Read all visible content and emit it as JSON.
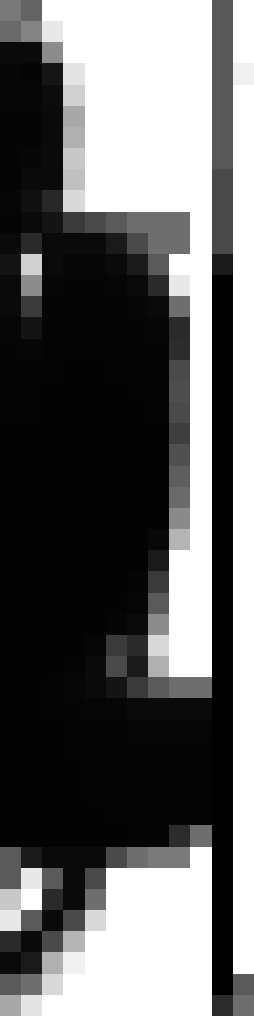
{
  "view": {
    "kind": "magnified-screenshot-crop",
    "description": "Extreme nearest-neighbour magnification of a small screenshot region; anti-aliased dark glyph/UI edges over a white background with a dark vertical bar at the right.",
    "width_px": 254,
    "height_px": 1016,
    "grid_columns": 12,
    "grid_rows": 48,
    "block_width_px": 21.17,
    "block_height_px": 21.17,
    "interpolation": "nearest-neighbor",
    "color_mode": "grayscale"
  },
  "palette": {
    "white": "#ffffff",
    "near_white": "#f4f4f4",
    "light_gray": "#d8d8d8",
    "mid_light_gray": "#b4b4b4",
    "mid_gray": "#8c8c8c",
    "slate_gray": "#6e6e6e",
    "dark_gray": "#4a4a4a",
    "darker_gray": "#2c2c2c",
    "near_black": "#141414",
    "black": "#000000"
  },
  "regions": [
    {
      "name": "top-left-dark-mass",
      "note": "Large black shape occupying the upper-left, bounded by a soft gray anti-alias ramp on its right edge."
    },
    {
      "name": "white-field",
      "note": "Bright white background filling the upper-right and mid-right of the crop."
    },
    {
      "name": "right-vertical-bar",
      "note": "Dark vertical band along column 10, grading from mid gray at the top to solid black below."
    },
    {
      "name": "bottom-white-block",
      "note": "White rounded mass in the lower third with stepped gray anti-alias edges."
    }
  ],
  "pixels": [
    [
      "#787878",
      "#646464",
      "#ffffff",
      "#ffffff",
      "#ffffff",
      "#ffffff",
      "#ffffff",
      "#ffffff",
      "#ffffff",
      "#ffffff",
      "#585858",
      "#ffffff"
    ],
    [
      "#6a6a6a",
      "#848484",
      "#e8e8e8",
      "#ffffff",
      "#ffffff",
      "#ffffff",
      "#ffffff",
      "#ffffff",
      "#ffffff",
      "#ffffff",
      "#585858",
      "#ffffff"
    ],
    [
      "#0a0a0a",
      "#0a0a0a",
      "#8c8c8c",
      "#ffffff",
      "#ffffff",
      "#ffffff",
      "#ffffff",
      "#ffffff",
      "#ffffff",
      "#ffffff",
      "#585858",
      "#ffffff"
    ],
    [
      "#070707",
      "#050505",
      "#151515",
      "#e4e4e4",
      "#ffffff",
      "#ffffff",
      "#ffffff",
      "#ffffff",
      "#ffffff",
      "#ffffff",
      "#585858",
      "#f0f0f0"
    ],
    [
      "#060606",
      "#060606",
      "#0c0c0c",
      "#d0d0d0",
      "#ffffff",
      "#ffffff",
      "#ffffff",
      "#ffffff",
      "#ffffff",
      "#ffffff",
      "#585858",
      "#ffffff"
    ],
    [
      "#050505",
      "#050505",
      "#0a0a0a",
      "#a8a8a8",
      "#ffffff",
      "#ffffff",
      "#ffffff",
      "#ffffff",
      "#ffffff",
      "#ffffff",
      "#585858",
      "#ffffff"
    ],
    [
      "#050505",
      "#050505",
      "#0a0a0a",
      "#b0b0b0",
      "#ffffff",
      "#ffffff",
      "#ffffff",
      "#ffffff",
      "#ffffff",
      "#ffffff",
      "#585858",
      "#ffffff"
    ],
    [
      "#050505",
      "#070707",
      "#0a0a0a",
      "#c8c8c8",
      "#ffffff",
      "#ffffff",
      "#ffffff",
      "#ffffff",
      "#ffffff",
      "#ffffff",
      "#585858",
      "#ffffff"
    ],
    [
      "#040404",
      "#0a0a0a",
      "#0a0a0a",
      "#c0c0c0",
      "#ffffff",
      "#ffffff",
      "#ffffff",
      "#ffffff",
      "#ffffff",
      "#ffffff",
      "#4a4a4a",
      "#ffffff"
    ],
    [
      "#060606",
      "#101010",
      "#282828",
      "#d8d8d8",
      "#ffffff",
      "#ffffff",
      "#ffffff",
      "#ffffff",
      "#ffffff",
      "#ffffff",
      "#4a4a4a",
      "#ffffff"
    ],
    [
      "#050505",
      "#0a0a0a",
      "#141414",
      "#3a3a3a",
      "#4a4a4a",
      "#5a5a5a",
      "#6e6e6e",
      "#6e6e6e",
      "#6e6e6e",
      "#ffffff",
      "#4a4a4a",
      "#ffffff"
    ],
    [
      "#0a0a0a",
      "#2a2a2a",
      "#0a0a0a",
      "#0a0a0a",
      "#0a0a0a",
      "#1a1a1a",
      "#4a4a4a",
      "#6e6e6e",
      "#6e6e6e",
      "#ffffff",
      "#4a4a4a",
      "#ffffff"
    ],
    [
      "#141414",
      "#d0d0d0",
      "#0a0a0a",
      "#060606",
      "#060606",
      "#0a0a0a",
      "#1a1a1a",
      "#5a5a5a",
      "#ffffff",
      "#ffffff",
      "#1a1a1a",
      "#ffffff"
    ],
    [
      "#0a0a0a",
      "#8c8c8c",
      "#060606",
      "#050505",
      "#050505",
      "#060606",
      "#0a0a0a",
      "#2a2a2a",
      "#e8e8e8",
      "#ffffff",
      "#000000",
      "#ffffff"
    ],
    [
      "#0a0a0a",
      "#3a3a3a",
      "#050505",
      "#050505",
      "#050505",
      "#050505",
      "#060606",
      "#0a0a0a",
      "#6e6e6e",
      "#ffffff",
      "#000000",
      "#ffffff"
    ],
    [
      "#060606",
      "#141414",
      "#050505",
      "#040404",
      "#040404",
      "#050505",
      "#050505",
      "#060606",
      "#2a2a2a",
      "#ffffff",
      "#000000",
      "#ffffff"
    ],
    [
      "#050505",
      "#060606",
      "#040404",
      "#040404",
      "#040404",
      "#040404",
      "#050505",
      "#050505",
      "#2c2c2c",
      "#ffffff",
      "#000000",
      "#ffffff"
    ],
    [
      "#040404",
      "#040404",
      "#040404",
      "#030303",
      "#030303",
      "#040404",
      "#040404",
      "#050505",
      "#4a4a4a",
      "#ffffff",
      "#000000",
      "#ffffff"
    ],
    [
      "#040404",
      "#040404",
      "#030303",
      "#030303",
      "#030303",
      "#030303",
      "#040404",
      "#040404",
      "#4e4e4e",
      "#ffffff",
      "#000000",
      "#ffffff"
    ],
    [
      "#040404",
      "#040404",
      "#030303",
      "#030303",
      "#030303",
      "#030303",
      "#030303",
      "#040404",
      "#4a4a4a",
      "#ffffff",
      "#000000",
      "#ffffff"
    ],
    [
      "#030303",
      "#030303",
      "#030303",
      "#030303",
      "#030303",
      "#030303",
      "#030303",
      "#030303",
      "#3e3e3e",
      "#ffffff",
      "#000000",
      "#ffffff"
    ],
    [
      "#030303",
      "#030303",
      "#030303",
      "#030303",
      "#030303",
      "#030303",
      "#030303",
      "#030303",
      "#505050",
      "#ffffff",
      "#000000",
      "#ffffff"
    ],
    [
      "#030303",
      "#030303",
      "#030303",
      "#030303",
      "#030303",
      "#030303",
      "#030303",
      "#030303",
      "#5e5e5e",
      "#ffffff",
      "#000000",
      "#ffffff"
    ],
    [
      "#030303",
      "#030303",
      "#030303",
      "#030303",
      "#030303",
      "#030303",
      "#030303",
      "#030303",
      "#6a6a6a",
      "#ffffff",
      "#000000",
      "#ffffff"
    ],
    [
      "#030303",
      "#030303",
      "#030303",
      "#030303",
      "#030303",
      "#030303",
      "#030303",
      "#030303",
      "#8a8a8a",
      "#ffffff",
      "#000000",
      "#ffffff"
    ],
    [
      "#030303",
      "#030303",
      "#030303",
      "#030303",
      "#030303",
      "#030303",
      "#030303",
      "#080808",
      "#b4b4b4",
      "#ffffff",
      "#000000",
      "#ffffff"
    ],
    [
      "#030303",
      "#030303",
      "#030303",
      "#030303",
      "#030303",
      "#030303",
      "#030303",
      "#1a1a1a",
      "#ffffff",
      "#ffffff",
      "#000000",
      "#ffffff"
    ],
    [
      "#030303",
      "#030303",
      "#030303",
      "#030303",
      "#030303",
      "#030303",
      "#050505",
      "#3a3a3a",
      "#ffffff",
      "#ffffff",
      "#000000",
      "#ffffff"
    ],
    [
      "#030303",
      "#030303",
      "#030303",
      "#030303",
      "#030303",
      "#030303",
      "#060606",
      "#5a5a5a",
      "#ffffff",
      "#ffffff",
      "#000000",
      "#ffffff"
    ],
    [
      "#030303",
      "#030303",
      "#030303",
      "#030303",
      "#030303",
      "#050505",
      "#0a0a0a",
      "#8c8c8c",
      "#ffffff",
      "#ffffff",
      "#000000",
      "#ffffff"
    ],
    [
      "#030303",
      "#030303",
      "#030303",
      "#030303",
      "#060606",
      "#3a3a3a",
      "#2a2a2a",
      "#d8d8d8",
      "#ffffff",
      "#ffffff",
      "#000000",
      "#ffffff"
    ],
    [
      "#030303",
      "#030303",
      "#030303",
      "#050505",
      "#0a0a0a",
      "#4a4a4a",
      "#1a1a1a",
      "#b0b0b0",
      "#ffffff",
      "#ffffff",
      "#000000",
      "#ffffff"
    ],
    [
      "#030303",
      "#030303",
      "#040404",
      "#060606",
      "#0a0a0a",
      "#141414",
      "#3a3a3a",
      "#5a5a5a",
      "#6e6e6e",
      "#6e6e6e",
      "#000000",
      "#ffffff"
    ],
    [
      "#030303",
      "#030303",
      "#040404",
      "#050505",
      "#060606",
      "#060606",
      "#0a0a0a",
      "#0a0a0a",
      "#0a0a0a",
      "#0a0a0a",
      "#000000",
      "#ffffff"
    ],
    [
      "#030303",
      "#030303",
      "#030303",
      "#040404",
      "#050505",
      "#050505",
      "#060606",
      "#060606",
      "#060606",
      "#060606",
      "#000000",
      "#ffffff"
    ],
    [
      "#030303",
      "#030303",
      "#030303",
      "#040404",
      "#040404",
      "#050505",
      "#050505",
      "#050505",
      "#050505",
      "#050505",
      "#000000",
      "#ffffff"
    ],
    [
      "#030303",
      "#030303",
      "#030303",
      "#030303",
      "#040404",
      "#040404",
      "#050505",
      "#050505",
      "#050505",
      "#050505",
      "#000000",
      "#ffffff"
    ],
    [
      "#030303",
      "#030303",
      "#030303",
      "#030303",
      "#040404",
      "#040404",
      "#040404",
      "#050505",
      "#050505",
      "#050505",
      "#000000",
      "#ffffff"
    ],
    [
      "#030303",
      "#030303",
      "#030303",
      "#030303",
      "#030303",
      "#040404",
      "#040404",
      "#040404",
      "#050505",
      "#050505",
      "#000000",
      "#ffffff"
    ],
    [
      "#030303",
      "#030303",
      "#030303",
      "#030303",
      "#030303",
      "#030303",
      "#040404",
      "#040404",
      "#2c2c2c",
      "#6e6e6e",
      "#000000",
      "#ffffff"
    ],
    [
      "#5a5a5a",
      "#1a1a1a",
      "#0a0a0a",
      "#0a0a0a",
      "#0a0a0a",
      "#4a4a4a",
      "#6e6e6e",
      "#7a7a7a",
      "#7a7a7a",
      "#ffffff",
      "#000000",
      "#ffffff"
    ],
    [
      "#5a5a5a",
      "#e8e8e8",
      "#5a5a5a",
      "#0a0a0a",
      "#4a4a4a",
      "#ffffff",
      "#ffffff",
      "#ffffff",
      "#ffffff",
      "#ffffff",
      "#000000",
      "#ffffff"
    ],
    [
      "#c8c8c8",
      "#ffffff",
      "#2a2a2a",
      "#0a0a0a",
      "#6e6e6e",
      "#ffffff",
      "#ffffff",
      "#ffffff",
      "#ffffff",
      "#ffffff",
      "#000000",
      "#ffffff"
    ],
    [
      "#e8e8e8",
      "#5a5a5a",
      "#0a0a0a",
      "#4a4a4a",
      "#d8d8d8",
      "#ffffff",
      "#ffffff",
      "#ffffff",
      "#ffffff",
      "#ffffff",
      "#000000",
      "#ffffff"
    ],
    [
      "#2a2a2a",
      "#0a0a0a",
      "#4a4a4a",
      "#b4b4b4",
      "#ffffff",
      "#ffffff",
      "#ffffff",
      "#ffffff",
      "#ffffff",
      "#ffffff",
      "#000000",
      "#ffffff"
    ],
    [
      "#0a0a0a",
      "#1a1a1a",
      "#b0b0b0",
      "#f0f0f0",
      "#ffffff",
      "#ffffff",
      "#ffffff",
      "#ffffff",
      "#ffffff",
      "#ffffff",
      "#000000",
      "#ffffff"
    ],
    [
      "#5a5a5a",
      "#6e6e6e",
      "#d8d8d8",
      "#ffffff",
      "#ffffff",
      "#ffffff",
      "#ffffff",
      "#ffffff",
      "#ffffff",
      "#ffffff",
      "#000000",
      "#5a5a5a"
    ],
    [
      "#a8a8a8",
      "#e4e4e4",
      "#ffffff",
      "#ffffff",
      "#ffffff",
      "#ffffff",
      "#ffffff",
      "#ffffff",
      "#ffffff",
      "#ffffff",
      "#2c2c2c",
      "#6e6e6e"
    ]
  ]
}
